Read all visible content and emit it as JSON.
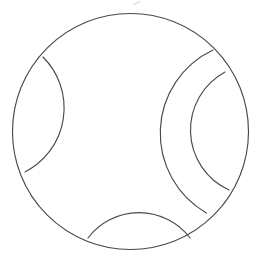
{
  "figure": {
    "title": "Circle with internal arc segments",
    "background_color": "#ffffff",
    "stroke_color": "#4a4a4a",
    "stroke_width": 1.15,
    "faint_stroke_color": "#bdbdbd",
    "width": 263,
    "height": 262
  },
  "geometry": {
    "outer_circle": {
      "name": "outer-circle",
      "cx": 130.5,
      "cy": 131.5,
      "r": 118.0
    },
    "arcs": [
      {
        "name": "left-lens-arc",
        "start_x": 43.0,
        "start_y": 57.0,
        "end_x": 25.0,
        "end_y": 172.0,
        "rx": 72.0,
        "ry": 72.0,
        "large_arc": 0,
        "sweep": 1
      },
      {
        "name": "right-outer-crescent-arc",
        "start_x": 213.0,
        "start_y": 50.0,
        "end_x": 206.5,
        "end_y": 213.0,
        "rx": 92.0,
        "ry": 92.0,
        "large_arc": 0,
        "sweep": 0
      },
      {
        "name": "right-inner-crescent-arc",
        "start_x": 225.0,
        "start_y": 72.0,
        "end_x": 229.0,
        "end_y": 190.0,
        "rx": 66.0,
        "ry": 66.0,
        "large_arc": 0,
        "sweep": 0
      },
      {
        "name": "bottom-lens-arc",
        "start_x": 88.0,
        "start_y": 238.0,
        "end_x": 190.0,
        "end_y": 238.0,
        "rx": 64.0,
        "ry": 64.0,
        "large_arc": 0,
        "sweep": 1
      }
    ],
    "artifact": {
      "name": "top-speck-artifact",
      "x": 134.0,
      "y": 3.0,
      "width": 6.0,
      "height": 3.0
    }
  }
}
